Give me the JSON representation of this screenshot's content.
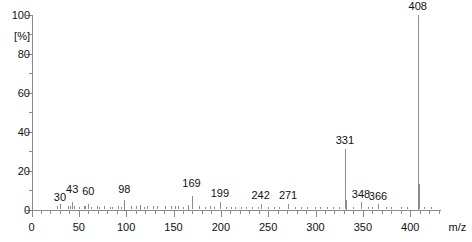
{
  "chart_data": {
    "type": "bar",
    "title": "",
    "subtitle": "",
    "xlabel": "m/z",
    "ylabel": "[%]",
    "xlim": [
      0,
      432
    ],
    "ylim": [
      0,
      100
    ],
    "grid": false,
    "legend": "none",
    "x_major_ticks": [
      0,
      50,
      100,
      150,
      200,
      250,
      300,
      350,
      400
    ],
    "x_minor_tick_step": 10,
    "y_major_ticks": [
      0,
      20,
      40,
      60,
      80,
      100
    ],
    "y_minor_tick_step": 10,
    "y_axis_unit_label": "[%]",
    "labeled_peaks": [
      {
        "mz": 30,
        "intensity": 3,
        "label": "30"
      },
      {
        "mz": 43,
        "intensity": 4,
        "label": "43"
      },
      {
        "mz": 60,
        "intensity": 3,
        "label": "60"
      },
      {
        "mz": 98,
        "intensity": 5,
        "label": "98"
      },
      {
        "mz": 169,
        "intensity": 7,
        "label": "169"
      },
      {
        "mz": 199,
        "intensity": 4,
        "label": "199"
      },
      {
        "mz": 242,
        "intensity": 3,
        "label": "242"
      },
      {
        "mz": 271,
        "intensity": 3,
        "label": "271"
      },
      {
        "mz": 331,
        "intensity": 31,
        "label": "331"
      },
      {
        "mz": 348,
        "intensity": 4,
        "label": "348"
      },
      {
        "mz": 366,
        "intensity": 3,
        "label": "366"
      },
      {
        "mz": 408,
        "intensity": 100,
        "label": "408"
      }
    ],
    "unlabeled_peaks": [
      {
        "mz": 27,
        "intensity": 2
      },
      {
        "mz": 39,
        "intensity": 2
      },
      {
        "mz": 41,
        "intensity": 2
      },
      {
        "mz": 45,
        "intensity": 2
      },
      {
        "mz": 50,
        "intensity": 1.5
      },
      {
        "mz": 55,
        "intensity": 2
      },
      {
        "mz": 57,
        "intensity": 2
      },
      {
        "mz": 63,
        "intensity": 1.5
      },
      {
        "mz": 69,
        "intensity": 2
      },
      {
        "mz": 71,
        "intensity": 1.5
      },
      {
        "mz": 77,
        "intensity": 2
      },
      {
        "mz": 83,
        "intensity": 1.5
      },
      {
        "mz": 85,
        "intensity": 1.5
      },
      {
        "mz": 91,
        "intensity": 2
      },
      {
        "mz": 95,
        "intensity": 1.5
      },
      {
        "mz": 105,
        "intensity": 2
      },
      {
        "mz": 110,
        "intensity": 2
      },
      {
        "mz": 115,
        "intensity": 2.5
      },
      {
        "mz": 119,
        "intensity": 1.5
      },
      {
        "mz": 122,
        "intensity": 2
      },
      {
        "mz": 128,
        "intensity": 2
      },
      {
        "mz": 133,
        "intensity": 2
      },
      {
        "mz": 141,
        "intensity": 2
      },
      {
        "mz": 147,
        "intensity": 2
      },
      {
        "mz": 152,
        "intensity": 2
      },
      {
        "mz": 155,
        "intensity": 2
      },
      {
        "mz": 160,
        "intensity": 1.5
      },
      {
        "mz": 165,
        "intensity": 2.5
      },
      {
        "mz": 177,
        "intensity": 2
      },
      {
        "mz": 183,
        "intensity": 1.5
      },
      {
        "mz": 189,
        "intensity": 2
      },
      {
        "mz": 193,
        "intensity": 1.5
      },
      {
        "mz": 205,
        "intensity": 1.5
      },
      {
        "mz": 211,
        "intensity": 1.5
      },
      {
        "mz": 215,
        "intensity": 1.5
      },
      {
        "mz": 221,
        "intensity": 1.5
      },
      {
        "mz": 227,
        "intensity": 1.5
      },
      {
        "mz": 233,
        "intensity": 1.5
      },
      {
        "mz": 239,
        "intensity": 1.5
      },
      {
        "mz": 250,
        "intensity": 1.5
      },
      {
        "mz": 256,
        "intensity": 1.5
      },
      {
        "mz": 261,
        "intensity": 1.5
      },
      {
        "mz": 278,
        "intensity": 1.5
      },
      {
        "mz": 285,
        "intensity": 1.5
      },
      {
        "mz": 291,
        "intensity": 1.5
      },
      {
        "mz": 299,
        "intensity": 1.5
      },
      {
        "mz": 305,
        "intensity": 1.5
      },
      {
        "mz": 312,
        "intensity": 1.5
      },
      {
        "mz": 318,
        "intensity": 1.5
      },
      {
        "mz": 325,
        "intensity": 1.5
      },
      {
        "mz": 332,
        "intensity": 5
      },
      {
        "mz": 340,
        "intensity": 1.5
      },
      {
        "mz": 355,
        "intensity": 1.5
      },
      {
        "mz": 360,
        "intensity": 1.5
      },
      {
        "mz": 374,
        "intensity": 1.5
      },
      {
        "mz": 380,
        "intensity": 1.5
      },
      {
        "mz": 390,
        "intensity": 1.5
      },
      {
        "mz": 397,
        "intensity": 1.5
      },
      {
        "mz": 409,
        "intensity": 13
      },
      {
        "mz": 415,
        "intensity": 1.5
      },
      {
        "mz": 422,
        "intensity": 1.5
      }
    ],
    "colors": {
      "peak": "#8c8c8c",
      "axis": "#8a8a8a",
      "text": "#111111",
      "background": "#ffffff"
    }
  }
}
